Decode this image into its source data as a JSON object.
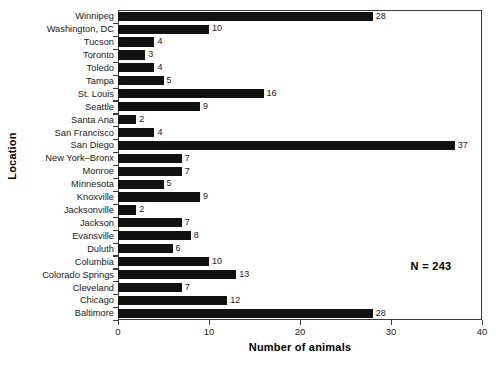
{
  "chart_data": {
    "type": "bar",
    "orientation": "horizontal",
    "title": "",
    "xlabel": "Number of animals",
    "ylabel": "Location",
    "xlim": [
      0,
      40
    ],
    "xticks": [
      0,
      10,
      20,
      30,
      40
    ],
    "grid": false,
    "legend": null,
    "annotation": "N = 243",
    "bar_color": "#111111",
    "axis_color": "#3a3a3a",
    "show_value_labels": true,
    "categories": [
      "Winnipeg",
      "Washington, DC",
      "Tucson",
      "Toronto",
      "Toledo",
      "Tampa",
      "St. Louis",
      "Seattle",
      "Santa Ana",
      "San Francisco",
      "San Diego",
      "New York–Bronx",
      "Monroe",
      "Minnesota",
      "Knoxville",
      "Jacksonville",
      "Jackson",
      "Evansville",
      "Duluth",
      "Columbia",
      "Colorado Springs",
      "Cleveland",
      "Chicago",
      "Baltimore"
    ],
    "values": [
      28,
      10,
      4,
      3,
      4,
      5,
      16,
      9,
      2,
      4,
      37,
      7,
      7,
      5,
      9,
      2,
      7,
      8,
      6,
      10,
      13,
      7,
      12,
      28
    ],
    "value_labels": [
      "28",
      "10",
      "4",
      "3",
      "4",
      "5",
      "16",
      "9",
      "2",
      "4",
      "37",
      "7",
      "7",
      "5",
      "9",
      "2",
      "7",
      "8",
      "6",
      "10",
      "13",
      "7",
      "12",
      "28"
    ],
    "xtick_labels": [
      "0",
      "10",
      "20",
      "30",
      "40"
    ]
  }
}
